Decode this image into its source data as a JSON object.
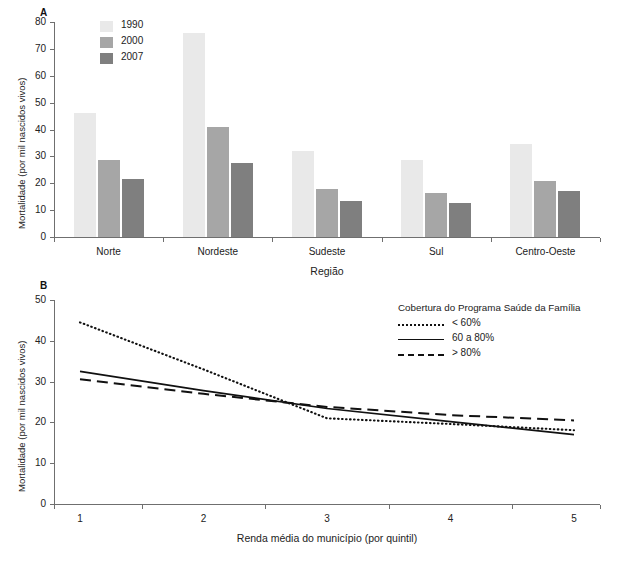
{
  "chart_data": [
    {
      "type": "bar",
      "panel": "A",
      "title": "",
      "xlabel": "Região",
      "ylabel": "Mortalidade (por mil nascidos vivos)",
      "ylim": [
        0,
        80
      ],
      "yticks": [
        0,
        10,
        20,
        30,
        40,
        50,
        60,
        70,
        80
      ],
      "grid": false,
      "legend_position": "top-left",
      "categories": [
        "Norte",
        "Nordeste",
        "Sudeste",
        "Sul",
        "Centro-Oeste"
      ],
      "series": [
        {
          "name": "1990",
          "color": "#e9e9e9",
          "values": [
            46,
            76,
            32,
            28.5,
            34.5
          ]
        },
        {
          "name": "2000",
          "color": "#a6a6a6",
          "values": [
            28.5,
            41,
            18,
            16.5,
            21
          ]
        },
        {
          "name": "2007",
          "color": "#7f7f7f",
          "values": [
            21.5,
            27.5,
            13.5,
            12.5,
            17
          ]
        }
      ]
    },
    {
      "type": "line",
      "panel": "B",
      "title": "",
      "xlabel": "Renda média do município (por quintil)",
      "ylabel": "Mortalidade (por mil nascidos vivos)",
      "legend_title": "Cobertura do Programa Saúde da Família",
      "legend_position": "top-right",
      "ylim": [
        0,
        50
      ],
      "yticks": [
        0,
        10,
        20,
        30,
        40,
        50
      ],
      "xlim": [
        1,
        5
      ],
      "xticks": [
        1,
        2,
        3,
        4,
        5
      ],
      "x": [
        1,
        2,
        3,
        4,
        5
      ],
      "grid": false,
      "series": [
        {
          "name": "< 60%",
          "style": "dotted",
          "color": "#111111",
          "values": [
            44.5,
            33.0,
            21.0,
            19.6,
            18.1
          ]
        },
        {
          "name": "60 a 80%",
          "style": "solid",
          "color": "#111111",
          "values": [
            32.5,
            27.8,
            23.4,
            20.2,
            17.0
          ]
        },
        {
          "name": "> 80%",
          "style": "dashed",
          "color": "#111111",
          "values": [
            30.6,
            27.0,
            23.8,
            21.8,
            20.5
          ]
        }
      ]
    }
  ],
  "panelA": {
    "letter": "A",
    "ylabel": "Mortalidade (por mil nascidos vivos)",
    "xlabel": "Região",
    "yticks": [
      "0",
      "10",
      "20",
      "30",
      "40",
      "50",
      "60",
      "70",
      "80"
    ],
    "categories": [
      "Norte",
      "Nordeste",
      "Sudeste",
      "Sul",
      "Centro-Oeste"
    ],
    "legend": [
      {
        "label": "1990",
        "color": "#e9e9e9"
      },
      {
        "label": "2000",
        "color": "#a6a6a6"
      },
      {
        "label": "2007",
        "color": "#7f7f7f"
      }
    ]
  },
  "panelB": {
    "letter": "B",
    "ylabel": "Mortalidade (por mil nascidos vivos)",
    "xlabel": "Renda média do município (por quintil)",
    "yticks": [
      "0",
      "10",
      "20",
      "30",
      "40",
      "50"
    ],
    "xticks": [
      "1",
      "2",
      "3",
      "4",
      "5"
    ],
    "legend_title": "Cobertura do Programa Saúde da Família",
    "legend": [
      {
        "label": "< 60%",
        "style": "dotted"
      },
      {
        "label": "60 a 80%",
        "style": "solid"
      },
      {
        "label": "> 80%",
        "style": "dashed"
      }
    ]
  }
}
